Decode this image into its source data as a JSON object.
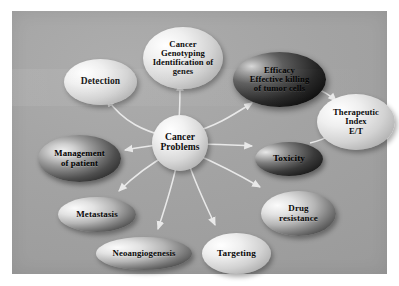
{
  "figure": {
    "type": "concept-map",
    "background_color": "#a5a5a5",
    "frame_color": "#ffffff",
    "arrow_color": "#e9e9e9",
    "text_color": "#0b0b0b"
  },
  "center": {
    "id": "cancer-problems",
    "label": "Cancer\nProblems",
    "lines": [
      "Cancer",
      "Problems"
    ],
    "style": "light-sphere"
  },
  "nodes": [
    {
      "id": "detection",
      "lines": [
        "Detection"
      ],
      "style": "light",
      "x": 52,
      "y": 48,
      "w": 73,
      "h": 46,
      "font": 9.5
    },
    {
      "id": "cancer-genotyping",
      "lines": [
        "Cancer",
        "Genotyping",
        "Identification of",
        "genes"
      ],
      "style": "light",
      "x": 131,
      "y": 16,
      "w": 80,
      "h": 62,
      "font": 8.6
    },
    {
      "id": "efficacy",
      "lines": [
        "Efficacy",
        "Effective killing",
        "of tumor cells"
      ],
      "style": "very-dark",
      "x": 221,
      "y": 41,
      "w": 93,
      "h": 55,
      "font": 8.6
    },
    {
      "id": "therapeutic-index",
      "lines": [
        "Therapeutic",
        "Index",
        "E/T"
      ],
      "style": "light",
      "x": 305,
      "y": 83,
      "w": 78,
      "h": 56,
      "font": 8.6
    },
    {
      "id": "toxicity",
      "lines": [
        "Toxicity"
      ],
      "style": "dark",
      "x": 243,
      "y": 131,
      "w": 68,
      "h": 34,
      "font": 9.2
    },
    {
      "id": "management-of-patient",
      "lines": [
        "Management",
        "of patient"
      ],
      "style": "dark2",
      "x": 26,
      "y": 124,
      "w": 83,
      "h": 47,
      "font": 8.8
    },
    {
      "id": "metastasis",
      "lines": [
        "Metastasis"
      ],
      "style": "half-dark",
      "x": 46,
      "y": 186,
      "w": 78,
      "h": 35,
      "font": 9.0
    },
    {
      "id": "neoangiogenesis",
      "lines": [
        "Neoangiogenesis"
      ],
      "style": "half-dark",
      "x": 84,
      "y": 226,
      "w": 96,
      "h": 33,
      "font": 8.8
    },
    {
      "id": "targeting",
      "lines": [
        "Targeting"
      ],
      "style": "light",
      "x": 190,
      "y": 222,
      "w": 69,
      "h": 41,
      "font": 9.2
    },
    {
      "id": "drug-resistance",
      "lines": [
        "Drug",
        "resistance"
      ],
      "style": "half-dark",
      "x": 249,
      "y": 180,
      "w": 75,
      "h": 45,
      "font": 9.0
    }
  ],
  "edges": [
    {
      "from": "cancer-problems",
      "to": "detection"
    },
    {
      "from": "cancer-problems",
      "to": "cancer-genotyping"
    },
    {
      "from": "cancer-problems",
      "to": "efficacy"
    },
    {
      "from": "cancer-problems",
      "to": "toxicity"
    },
    {
      "from": "cancer-problems",
      "to": "management-of-patient"
    },
    {
      "from": "cancer-problems",
      "to": "metastasis"
    },
    {
      "from": "cancer-problems",
      "to": "neoangiogenesis"
    },
    {
      "from": "cancer-problems",
      "to": "targeting"
    },
    {
      "from": "cancer-problems",
      "to": "drug-resistance"
    },
    {
      "from": "efficacy",
      "to": "therapeutic-index"
    },
    {
      "from": "toxicity",
      "to": "therapeutic-index"
    }
  ]
}
